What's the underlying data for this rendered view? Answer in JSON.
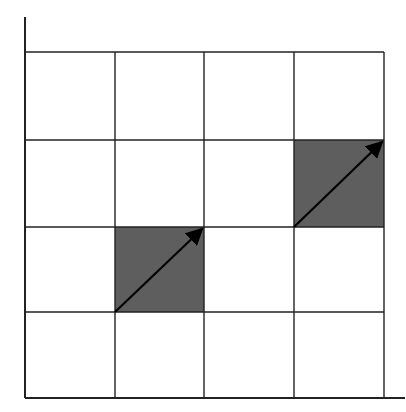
{
  "diagram": {
    "type": "grid-with-shaded-cells-and-arrows",
    "grid": {
      "columns": 4,
      "rows": 4
    },
    "colors": {
      "line": "#222222",
      "shade": "#5e5e5e",
      "arrow": "#000000",
      "background": "#ffffff"
    },
    "shaded_cells": [
      {
        "col": 1,
        "row": 2
      },
      {
        "col": 3,
        "row": 1
      }
    ],
    "arrows": [
      {
        "from": "bottom-left of cell (col 1, row 2)",
        "to": "top-right of cell (col 1, row 2)"
      },
      {
        "from": "bottom-left of cell (col 3, row 1)",
        "to": "top-right of cell (col 3, row 1)"
      }
    ]
  }
}
